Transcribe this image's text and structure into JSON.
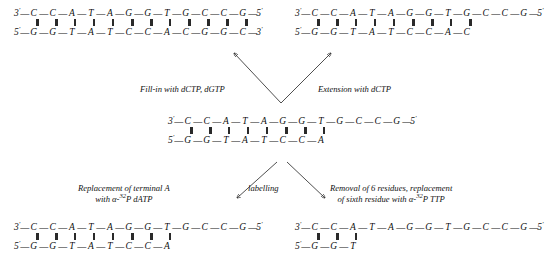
{
  "figure": {
    "background_color": "#ffffff",
    "ink_color": "#111111"
  },
  "duplexes": [
    {
      "id": "top-left",
      "name": "duplex-top-left",
      "top_strand": {
        "left_end": "3'",
        "right_end": "5'",
        "bases": [
          "C",
          "C",
          "A",
          "T",
          "A",
          "G",
          "G",
          "T",
          "G",
          "C",
          "C",
          "G"
        ]
      },
      "bottom_strand": {
        "left_end": "5'",
        "right_end": "3'",
        "bases": [
          "G",
          "G",
          "T",
          "A",
          "T",
          "C",
          "C",
          "A",
          "C",
          "G",
          "G",
          "C"
        ]
      },
      "bond_pattern": [
        3,
        3,
        1,
        1,
        1,
        3,
        3,
        1,
        3,
        3,
        3,
        3
      ]
    },
    {
      "id": "top-right",
      "name": "duplex-top-right",
      "top_strand": {
        "left_end": "3'",
        "right_end": "5'",
        "bases": [
          "C",
          "C",
          "A",
          "T",
          "A",
          "G",
          "G",
          "T",
          "G",
          "C",
          "C",
          "G"
        ]
      },
      "bottom_strand": {
        "left_end": "5'",
        "right_end": "",
        "bases": [
          "G",
          "G",
          "T",
          "A",
          "T",
          "C",
          "C",
          "A",
          "C"
        ]
      },
      "bond_pattern": [
        3,
        3,
        1,
        1,
        1,
        3,
        3,
        1,
        3
      ]
    },
    {
      "id": "middle",
      "name": "duplex-middle",
      "top_strand": {
        "left_end": "3'",
        "right_end": "5'",
        "bases": [
          "C",
          "C",
          "A",
          "T",
          "A",
          "G",
          "G",
          "T",
          "G",
          "C",
          "C",
          "G"
        ]
      },
      "bottom_strand": {
        "left_end": "5'",
        "right_end": "",
        "bases": [
          "G",
          "G",
          "T",
          "A",
          "T",
          "C",
          "C",
          "A"
        ]
      },
      "bond_pattern": [
        3,
        3,
        1,
        1,
        1,
        3,
        3,
        1
      ]
    },
    {
      "id": "bottom-left",
      "name": "duplex-bottom-left",
      "top_strand": {
        "left_end": "3'",
        "right_end": "5'",
        "bases": [
          "C",
          "C",
          "A",
          "T",
          "A",
          "G",
          "G",
          "T",
          "G",
          "C",
          "C",
          "G"
        ]
      },
      "bottom_strand": {
        "left_end": "5'",
        "right_end": "",
        "bases": [
          "G",
          "G",
          "T",
          "A",
          "T",
          "C",
          "C",
          "A"
        ]
      },
      "bond_pattern": [
        3,
        3,
        1,
        1,
        1,
        3,
        3,
        1
      ]
    },
    {
      "id": "bottom-right",
      "name": "duplex-bottom-right",
      "top_strand": {
        "left_end": "3'",
        "right_end": "5'",
        "bases": [
          "C",
          "C",
          "A",
          "T",
          "A",
          "G",
          "G",
          "T",
          "G",
          "C",
          "C",
          "G"
        ]
      },
      "bottom_strand": {
        "left_end": "5'",
        "right_end": "",
        "bases": [
          "G",
          "G",
          "T"
        ]
      },
      "bond_pattern": [
        3,
        3,
        1
      ]
    }
  ],
  "labels": {
    "fill_in": "Fill-in with dCTP, dGTP",
    "extension": "Extension with dCTP",
    "replacement_line1": "Replacement of terminal  A",
    "replacement_line2_pre": "with  α-",
    "replacement_line2_sup": "32",
    "replacement_line2_post": "P dATP",
    "labelling": "labelling",
    "removal_line1": "Removal of 6 residues, replacement",
    "removal_line2_pre": "of sixth residue with α-",
    "removal_line2_sup": "32",
    "removal_line2_post": "P TTP"
  },
  "caption": {
    "text": ""
  }
}
